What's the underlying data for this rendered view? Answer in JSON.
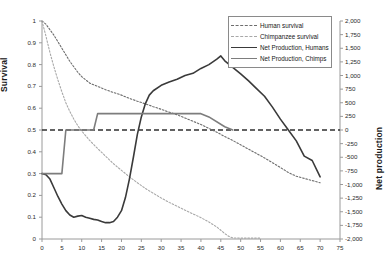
{
  "chart_data": {
    "type": "line",
    "title": "",
    "xlabel": "",
    "ylabel": "Survival",
    "y2label": "Net production",
    "xlim": [
      0,
      75
    ],
    "ylim": [
      0,
      1
    ],
    "y2lim": [
      -2000,
      2000
    ],
    "grid": false,
    "legend_position": "top-right",
    "xticks": [
      "0",
      "5",
      "10",
      "15",
      "20",
      "25",
      "30",
      "35",
      "40",
      "45",
      "50",
      "55",
      "60",
      "65",
      "70",
      "75"
    ],
    "yticks": [
      "0",
      "0.1",
      "0.2",
      "0.3",
      "0.4",
      "0.5",
      "0.6",
      "0.7",
      "0.8",
      "0.9",
      "1"
    ],
    "y2ticks": [
      "-2,000",
      "-1,750",
      "-1,500",
      "-1,250",
      "-1,000",
      "-750",
      "-500",
      "-250",
      "0",
      "250",
      "500",
      "750",
      "1,000",
      "1,250",
      "1,500",
      "1,750",
      "2,000"
    ],
    "zero_reference_line": 0,
    "series": [
      {
        "name": "Human survival",
        "axis": "left",
        "style": "dashed",
        "color": "#6d6d6d",
        "x": [
          0,
          1,
          2,
          3,
          4,
          5,
          6,
          7,
          8,
          9,
          10,
          12,
          14,
          16,
          18,
          20,
          22,
          24,
          26,
          28,
          30,
          32,
          34,
          36,
          38,
          40,
          42,
          44,
          46,
          48,
          50,
          52,
          54,
          56,
          58,
          60,
          62,
          64,
          66,
          68,
          70
        ],
        "values": [
          1.0,
          0.985,
          0.96,
          0.935,
          0.905,
          0.875,
          0.845,
          0.815,
          0.79,
          0.765,
          0.745,
          0.715,
          0.7,
          0.685,
          0.672,
          0.66,
          0.645,
          0.632,
          0.62,
          0.607,
          0.595,
          0.582,
          0.57,
          0.555,
          0.54,
          0.525,
          0.507,
          0.49,
          0.47,
          0.452,
          0.432,
          0.412,
          0.392,
          0.372,
          0.35,
          0.328,
          0.305,
          0.288,
          0.278,
          0.268,
          0.258
        ]
      },
      {
        "name": "Chimpanzee survival",
        "axis": "left",
        "style": "dashed",
        "color": "#a8a8a8",
        "x": [
          0,
          1,
          2,
          3,
          4,
          5,
          6,
          7,
          8,
          9,
          10,
          12,
          14,
          16,
          18,
          20,
          22,
          24,
          26,
          28,
          30,
          32,
          34,
          36,
          38,
          40,
          42,
          44,
          45,
          46,
          47,
          48,
          50,
          52,
          54,
          55
        ],
        "values": [
          1.0,
          0.93,
          0.855,
          0.79,
          0.73,
          0.675,
          0.625,
          0.585,
          0.55,
          0.52,
          0.495,
          0.452,
          0.415,
          0.38,
          0.345,
          0.315,
          0.285,
          0.258,
          0.232,
          0.21,
          0.188,
          0.168,
          0.15,
          0.132,
          0.115,
          0.098,
          0.078,
          0.055,
          0.04,
          0.025,
          0.012,
          0.005,
          0.004,
          0.004,
          0.004,
          0.004
        ]
      },
      {
        "name": "Net Production, Humans",
        "axis": "right",
        "style": "solid",
        "color": "#3a3a3a",
        "x": [
          0,
          1,
          2,
          3,
          4,
          5,
          6,
          7,
          8,
          9,
          10,
          11,
          12,
          13,
          14,
          15,
          16,
          17,
          18,
          19,
          20,
          21,
          22,
          23,
          24,
          25,
          26,
          27,
          28,
          30,
          32,
          34,
          36,
          38,
          40,
          42,
          44,
          45,
          46,
          48,
          50,
          52,
          54,
          56,
          58,
          60,
          62,
          64,
          66,
          68,
          70
        ],
        "values": [
          -800,
          -820,
          -900,
          -1060,
          -1220,
          -1360,
          -1480,
          -1560,
          -1600,
          -1580,
          -1570,
          -1600,
          -1620,
          -1640,
          -1650,
          -1680,
          -1700,
          -1700,
          -1680,
          -1600,
          -1480,
          -1240,
          -900,
          -500,
          -80,
          240,
          480,
          640,
          720,
          820,
          880,
          930,
          1000,
          1040,
          1130,
          1200,
          1300,
          1360,
          1270,
          1150,
          1030,
          900,
          760,
          620,
          420,
          200,
          0,
          -200,
          -480,
          -560,
          -860
        ]
      },
      {
        "name": "Net Production, Chimps",
        "axis": "right",
        "style": "solid",
        "color": "#7d7d7d",
        "x": [
          0,
          5,
          6,
          13,
          14,
          16,
          17,
          40,
          42,
          46,
          48
        ],
        "values": [
          -800,
          -800,
          0,
          0,
          300,
          300,
          300,
          300,
          240,
          60,
          0
        ]
      }
    ]
  },
  "legend": {
    "items": [
      {
        "label": "Human survival",
        "swatch": "sw-dash-dark"
      },
      {
        "label": "Chimpanzee survival",
        "swatch": "sw-dash-light"
      },
      {
        "label": "Net Production, Humans",
        "swatch": "sw-solid-dark"
      },
      {
        "label": "Net Production, Chimps",
        "swatch": "sw-solid-gray"
      }
    ]
  },
  "axes": {
    "left_title": "Survival",
    "right_title": "Net production"
  }
}
